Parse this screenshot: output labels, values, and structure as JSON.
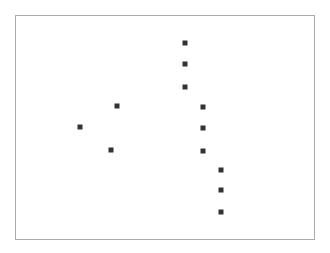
{
  "chart_data": {
    "type": "scatter",
    "title": "",
    "xlabel": "",
    "ylabel": "",
    "grid": false,
    "legend": null,
    "frame": {
      "left": 15,
      "top": 15,
      "right": 314,
      "bottom": 239,
      "color": "#ababab"
    },
    "marker": {
      "shape": "square",
      "size": 5,
      "color": "#333333"
    },
    "points_px": [
      {
        "x": 185,
        "y": 43
      },
      {
        "x": 185,
        "y": 64
      },
      {
        "x": 185,
        "y": 87
      },
      {
        "x": 117,
        "y": 106
      },
      {
        "x": 203,
        "y": 107
      },
      {
        "x": 80,
        "y": 127
      },
      {
        "x": 203,
        "y": 128
      },
      {
        "x": 111,
        "y": 150
      },
      {
        "x": 203,
        "y": 151
      },
      {
        "x": 221,
        "y": 170
      },
      {
        "x": 221,
        "y": 190
      },
      {
        "x": 221,
        "y": 212
      }
    ],
    "x": [
      0.22,
      0.33,
      0.35,
      0.57,
      0.57,
      0.57,
      0.63,
      0.63,
      0.63,
      0.69,
      0.69,
      0.69
    ],
    "y": [
      0.5,
      0.41,
      0.6,
      0.87,
      0.78,
      0.68,
      0.59,
      0.5,
      0.4,
      0.31,
      0.22,
      0.12
    ],
    "xlim": [
      0,
      1
    ],
    "ylim": [
      0,
      1
    ]
  }
}
